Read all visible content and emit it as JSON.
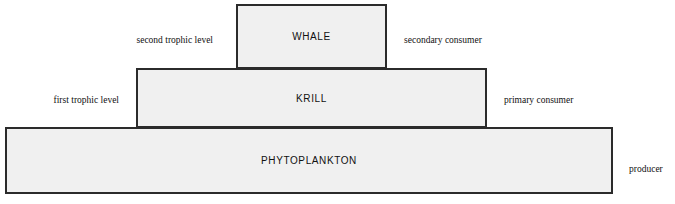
{
  "diagram": {
    "type": "ecological-pyramid",
    "colors": {
      "tier_fill": "#f0f0f0",
      "tier_border": "#2b2b2b",
      "text": "#101010",
      "background": "#ffffff"
    },
    "tiers": [
      {
        "id": "whale",
        "label": "WHALE",
        "level_label": "second trophic level",
        "role_label": "secondary consumer"
      },
      {
        "id": "krill",
        "label": "KRILL",
        "level_label": "first trophic level",
        "role_label": "primary consumer"
      },
      {
        "id": "phytoplankton",
        "label": "PHYTOPLANKTON",
        "level_label": "",
        "role_label": "producer"
      }
    ]
  }
}
